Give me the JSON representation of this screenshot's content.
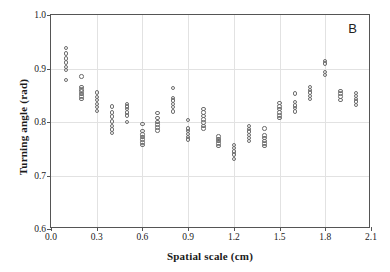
{
  "figure": {
    "panel_label": "B",
    "marker_style": "open-circle",
    "marker_color": "#6d6d6d",
    "frame_color": "#555555",
    "grid_color": "#e2e2e2",
    "background": "#ffffff"
  },
  "chart_data": {
    "type": "scatter",
    "title": "",
    "panel": "B",
    "xlabel": "Spatial scale (cm)",
    "ylabel": "Turning angle (rad)",
    "xlim": [
      0.0,
      2.1
    ],
    "ylim": [
      0.6,
      1.0
    ],
    "xticks": [
      0.0,
      0.3,
      0.6,
      0.9,
      1.2,
      1.5,
      1.8,
      2.1
    ],
    "xtick_labels": [
      "0.0",
      "0.3",
      "0.6",
      "0.9",
      "1.2",
      "1.5",
      "1.8",
      "2.1"
    ],
    "yticks": [
      0.6,
      0.7,
      0.8,
      0.9,
      1.0
    ],
    "ytick_labels": [
      "0.6",
      "0.7",
      "0.8",
      "0.9",
      "1.0"
    ],
    "grid": true,
    "legend": null,
    "series": [
      {
        "name": "turning angle replicates",
        "marker": "open-circle",
        "groups": [
          {
            "x": 0.1,
            "values": [
              0.938,
              0.928,
              0.919,
              0.911,
              0.903,
              0.897,
              0.879
            ]
          },
          {
            "x": 0.2,
            "values": [
              0.885,
              0.866,
              0.861,
              0.857,
              0.852,
              0.848,
              0.843
            ]
          },
          {
            "x": 0.3,
            "values": [
              0.855,
              0.847,
              0.841,
              0.834,
              0.828,
              0.821
            ]
          },
          {
            "x": 0.4,
            "values": [
              0.829,
              0.818,
              0.81,
              0.801,
              0.793,
              0.786,
              0.78
            ]
          },
          {
            "x": 0.5,
            "values": [
              0.834,
              0.829,
              0.824,
              0.818,
              0.812,
              0.8
            ]
          },
          {
            "x": 0.6,
            "values": [
              0.796,
              0.783,
              0.777,
              0.772,
              0.767,
              0.762,
              0.757
            ]
          },
          {
            "x": 0.7,
            "values": [
              0.817,
              0.808,
              0.8,
              0.795,
              0.79,
              0.784
            ]
          },
          {
            "x": 0.8,
            "values": [
              0.864,
              0.845,
              0.84,
              0.834,
              0.828,
              0.82
            ]
          },
          {
            "x": 0.9,
            "values": [
              0.804,
              0.788,
              0.783,
              0.778,
              0.772,
              0.767
            ]
          },
          {
            "x": 1.0,
            "values": [
              0.824,
              0.818,
              0.811,
              0.805,
              0.799,
              0.793,
              0.788
            ]
          },
          {
            "x": 1.1,
            "values": [
              0.773,
              0.768,
              0.764,
              0.76,
              0.755
            ]
          },
          {
            "x": 1.2,
            "values": [
              0.757,
              0.751,
              0.745,
              0.739,
              0.731
            ]
          },
          {
            "x": 1.3,
            "values": [
              0.793,
              0.787,
              0.782,
              0.776,
              0.77,
              0.764
            ]
          },
          {
            "x": 1.4,
            "values": [
              0.788,
              0.775,
              0.77,
              0.765,
              0.76,
              0.755
            ]
          },
          {
            "x": 1.5,
            "values": [
              0.836,
              0.829,
              0.824,
              0.818,
              0.812,
              0.807
            ]
          },
          {
            "x": 1.6,
            "values": [
              0.853,
              0.837,
              0.831,
              0.826,
              0.82
            ]
          },
          {
            "x": 1.7,
            "values": [
              0.866,
              0.86,
              0.855,
              0.849,
              0.843
            ]
          },
          {
            "x": 1.8,
            "values": [
              0.914,
              0.909,
              0.893,
              0.888
            ]
          },
          {
            "x": 1.9,
            "values": [
              0.858,
              0.853,
              0.848,
              0.841
            ]
          },
          {
            "x": 2.0,
            "values": [
              0.854,
              0.849,
              0.843,
              0.838,
              0.832
            ]
          }
        ]
      }
    ]
  }
}
